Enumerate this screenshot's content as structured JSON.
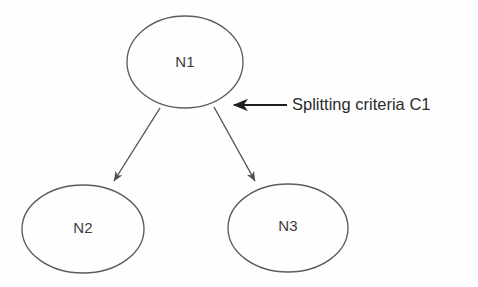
{
  "diagram": {
    "type": "decision-tree",
    "background_color": "#fefefe",
    "stroke_color": "#5c5c5c",
    "text_color": "#3b3b3b",
    "annotation_color": "#1f1f1f",
    "nodes": [
      {
        "id": "n1",
        "label": "N1",
        "role": "parent",
        "cx": 185,
        "cy": 62,
        "rx": 58,
        "ry": 46
      },
      {
        "id": "n2",
        "label": "N2",
        "role": "child-left",
        "cx": 83,
        "cy": 229,
        "rx": 61,
        "ry": 44
      },
      {
        "id": "n3",
        "label": "N3",
        "role": "child-right",
        "cx": 288,
        "cy": 228,
        "rx": 60,
        "ry": 44
      }
    ],
    "edges": [
      {
        "id": "edge-n1-n2",
        "from": "n1",
        "to": "n2",
        "x1": 160,
        "y1": 108,
        "x2": 113,
        "y2": 183,
        "arrowhead": "to"
      },
      {
        "id": "edge-n1-n3",
        "from": "n1",
        "to": "n3",
        "x1": 214,
        "y1": 107,
        "x2": 256,
        "y2": 183,
        "arrowhead": "to"
      }
    ],
    "annotation": {
      "id": "splitting-criteria",
      "text": "Splitting criteria C1",
      "arrow_tail_x": 287,
      "arrow_head_x": 233,
      "arrow_y": 105,
      "text_x": 292,
      "text_y": 105
    }
  }
}
